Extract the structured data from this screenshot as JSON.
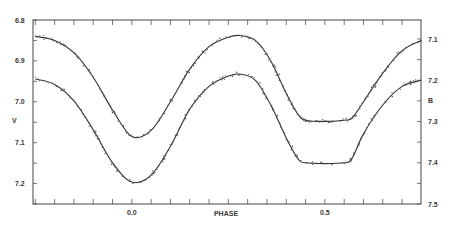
{
  "chart_data": {
    "type": "line",
    "title": "",
    "xlabel": "PHASE",
    "ylabel": "V",
    "right_ylabel": "B",
    "xlim": [
      -0.256,
      0.749
    ],
    "ylim": [
      7.25,
      6.8
    ],
    "right_ylim": [
      7.5,
      7.05
    ],
    "x_ticks_major": [
      {
        "value": 0.0,
        "label": "0.0"
      },
      {
        "value": 0.5,
        "label": "0.5"
      }
    ],
    "x_tick_step": 0.05,
    "y_ticks": [
      {
        "value": 6.8,
        "label": "6.8"
      },
      {
        "value": 6.9,
        "label": "6.9"
      },
      {
        "value": 7.0,
        "label": "7.0"
      },
      {
        "value": 7.1,
        "label": "7.1"
      },
      {
        "value": 7.2,
        "label": "7.2"
      }
    ],
    "right_y_ticks": [
      {
        "value": 7.1,
        "label": "7.1"
      },
      {
        "value": 7.2,
        "label": "7.2"
      },
      {
        "value": 7.3,
        "label": "7.3"
      },
      {
        "value": 7.4,
        "label": "7.4"
      },
      {
        "value": 7.5,
        "label": "7.5"
      }
    ],
    "grid": false,
    "legend": null,
    "series": [
      {
        "name": "V",
        "axis": "left",
        "x": [
          -0.25,
          -0.2,
          -0.15,
          -0.1,
          -0.05,
          0.0,
          0.05,
          0.1,
          0.15,
          0.2,
          0.25,
          0.28,
          0.32,
          0.36,
          0.4,
          0.43,
          0.45,
          0.5,
          0.55,
          0.57,
          0.6,
          0.65,
          0.7,
          0.75
        ],
        "values": [
          6.84,
          6.85,
          6.88,
          6.94,
          7.02,
          7.085,
          7.07,
          7.0,
          6.92,
          6.865,
          6.842,
          6.838,
          6.85,
          6.9,
          6.98,
          7.03,
          7.045,
          7.048,
          7.045,
          7.04,
          7.0,
          6.93,
          6.875,
          6.85
        ]
      },
      {
        "name": "B",
        "axis": "right",
        "x": [
          -0.25,
          -0.2,
          -0.15,
          -0.1,
          -0.05,
          0.0,
          0.05,
          0.1,
          0.15,
          0.2,
          0.25,
          0.28,
          0.32,
          0.36,
          0.4,
          0.43,
          0.45,
          0.5,
          0.55,
          0.57,
          0.6,
          0.65,
          0.7,
          0.75
        ],
        "values": [
          7.197,
          7.21,
          7.25,
          7.32,
          7.4,
          7.447,
          7.43,
          7.36,
          7.27,
          7.215,
          7.19,
          7.185,
          7.2,
          7.26,
          7.34,
          7.39,
          7.4,
          7.402,
          7.4,
          7.39,
          7.33,
          7.26,
          7.215,
          7.2
        ]
      }
    ]
  }
}
